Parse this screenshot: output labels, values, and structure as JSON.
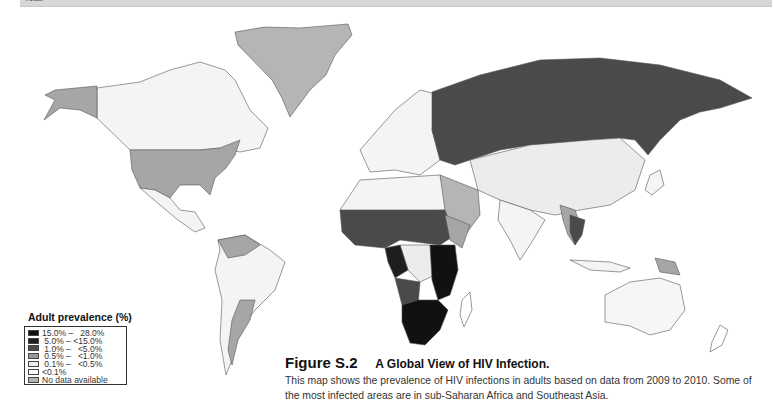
{
  "header": {
    "partial_text": "Total"
  },
  "legend": {
    "title": "Adult prevalence (%)",
    "items": [
      {
        "label": "15.0% –   28.0%",
        "color": "#111111"
      },
      {
        "label": " 5.0% – <15.0%",
        "color": "#1e1e1e"
      },
      {
        "label": " 1.0% –   <5.0%",
        "color": "#4a4a4a"
      },
      {
        "label": " 0.5% –   <1.0%",
        "color": "#9a9a9a"
      },
      {
        "label": " 0.1% –   <0.5%",
        "color": "#ececec"
      },
      {
        "label": "<0.1%",
        "color": "#ffffff"
      },
      {
        "label": "No data available",
        "color": "#b5b5b5"
      }
    ]
  },
  "caption": {
    "figure_label": "Figure S.2",
    "title": "A Global View of HIV Infection.",
    "body": "This map shows the prevalence of HIV infections in adults based on data from 2009 to 2010. Some of the most infected areas are in sub-Saharan Africa and Southeast Asia."
  },
  "map": {
    "regions": [
      {
        "name": "greenland",
        "category": "No data available"
      },
      {
        "name": "alaska-usa",
        "category": "0.5% – <1.0%"
      },
      {
        "name": "canada",
        "category": "0.1% – <0.5%"
      },
      {
        "name": "russia",
        "category": "1.0% – <5.0%"
      },
      {
        "name": "southern-africa",
        "category": "15.0% – 28.0%"
      },
      {
        "name": "east-africa",
        "category": "5.0% – <15.0%"
      },
      {
        "name": "west-central-africa",
        "category": "1.0% – <5.0%"
      },
      {
        "name": "thailand",
        "category": "1.0% – <5.0%"
      },
      {
        "name": "australia",
        "category": "<0.1%"
      },
      {
        "name": "argentina",
        "category": "0.5% – <1.0%"
      }
    ]
  }
}
